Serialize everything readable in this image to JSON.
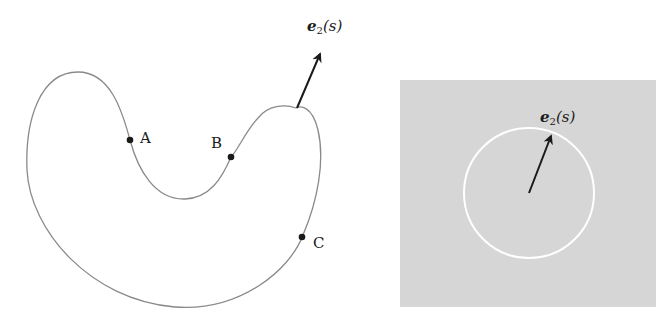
{
  "figure": {
    "left_panel": {
      "description": "Closed kidney-shaped plane curve with marked points and unit normal vector",
      "points": [
        {
          "label": "A"
        },
        {
          "label": "B"
        },
        {
          "label": "C"
        }
      ],
      "vector_label_main": "e",
      "vector_label_sub": "2",
      "vector_label_arg": "(s)"
    },
    "right_panel": {
      "description": "Unit circle on gray background with normal vector e2(s) from center",
      "vector_label_main": "e",
      "vector_label_sub": "2",
      "vector_label_arg": "(s)"
    },
    "colors": {
      "curve": "#8a8a8a",
      "point": "#1a1a1a",
      "arrow": "#1a1a1a",
      "panel_bg": "#d6d6d6",
      "circle": "#ffffff"
    }
  }
}
